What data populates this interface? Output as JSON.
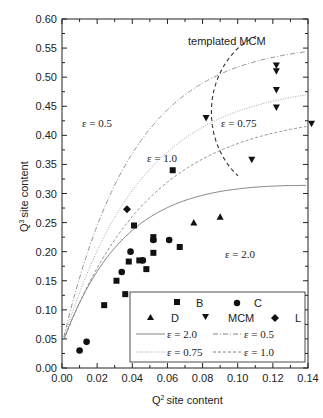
{
  "chart_data": {
    "type": "scatter",
    "title": "",
    "xlabel": "Q2 site content",
    "ylabel": "Q3 site content",
    "xlim": [
      0.0,
      0.14
    ],
    "ylim": [
      0.0,
      0.6
    ],
    "xticks": [
      "0.00",
      "0.02",
      "0.04",
      "0.06",
      "0.08",
      "0.10",
      "0.12",
      "0.14"
    ],
    "yticks": [
      "0.00",
      "0.05",
      "0.10",
      "0.15",
      "0.20",
      "0.25",
      "0.30",
      "0.35",
      "0.40",
      "0.45",
      "0.50",
      "0.55",
      "0.60"
    ],
    "grid": false,
    "legend_position": "lower right",
    "series": [
      {
        "name": "B",
        "marker": "square",
        "points": [
          [
            0.024,
            0.108
          ],
          [
            0.031,
            0.15
          ],
          [
            0.036,
            0.127
          ],
          [
            0.038,
            0.183
          ],
          [
            0.041,
            0.245
          ],
          [
            0.044,
            0.185
          ],
          [
            0.048,
            0.17
          ],
          [
            0.052,
            0.198
          ],
          [
            0.052,
            0.225
          ],
          [
            0.063,
            0.34
          ],
          [
            0.067,
            0.208
          ]
        ]
      },
      {
        "name": "C",
        "marker": "circle",
        "points": [
          [
            0.01,
            0.03
          ],
          [
            0.014,
            0.045
          ],
          [
            0.034,
            0.165
          ],
          [
            0.039,
            0.2
          ],
          [
            0.046,
            0.185
          ],
          [
            0.052,
            0.22
          ],
          [
            0.061,
            0.22
          ]
        ]
      },
      {
        "name": "D",
        "marker": "triangle-up",
        "points": [
          [
            0.052,
            0.222
          ],
          [
            0.075,
            0.25
          ],
          [
            0.09,
            0.26
          ]
        ]
      },
      {
        "name": "MCM",
        "marker": "triangle-down",
        "points": [
          [
            0.082,
            0.43
          ],
          [
            0.108,
            0.358
          ],
          [
            0.122,
            0.52
          ],
          [
            0.122,
            0.51
          ],
          [
            0.122,
            0.478
          ],
          [
            0.122,
            0.448
          ],
          [
            0.142,
            0.42
          ]
        ]
      },
      {
        "name": "L",
        "marker": "diamond",
        "points": [
          [
            0.037,
            0.273
          ]
        ]
      }
    ],
    "curves": [
      {
        "name": "ε = 2.0",
        "style": "solid",
        "label_at": [
          0.09,
          0.178
        ]
      },
      {
        "name": "ε = 0.5",
        "style": "dash-dot",
        "label_at": [
          0.04,
          0.43
        ]
      },
      {
        "name": "ε = 0.75",
        "style": "dotted",
        "label_at": [
          0.093,
          0.43
        ]
      },
      {
        "name": "ε = 1.0",
        "style": "dashed",
        "label_at": [
          0.062,
          0.345
        ]
      }
    ],
    "annotations": [
      {
        "text": "templated MCM",
        "at": [
          0.098,
          0.572
        ]
      }
    ]
  },
  "labels": {
    "x_axis": "site content",
    "y_axis": "site content",
    "x_sup": "2",
    "y_sup": "3",
    "q": "Q",
    "templated": "templated MCM",
    "eps20": "ε = 2.0",
    "eps05": "ε = 0.5",
    "eps075": "ε = 0.75",
    "eps10": "ε = 1.0"
  },
  "legend": {
    "B": "B",
    "C": "C",
    "D": "D",
    "MCM": "MCM",
    "L": "L",
    "e20": "ε = 2.0",
    "e05": "ε = 0.5",
    "e075": "ε = 0.75",
    "e10": "ε = 1.0"
  }
}
